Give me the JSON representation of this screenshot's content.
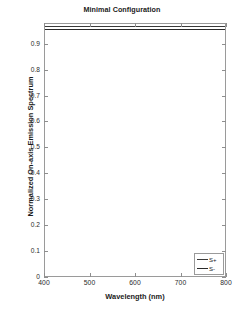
{
  "chart_data": {
    "type": "line",
    "title": "Minimal Configuration",
    "xlabel": "Wavelength (nm)",
    "ylabel": "Normalized On-axis Emission Spectrum",
    "xlim": [
      400,
      800
    ],
    "ylim": [
      0,
      0.98
    ],
    "grid": false,
    "legend_position": "lower right",
    "xticks": [
      400,
      500,
      600,
      700,
      800
    ],
    "xtick_labels": [
      "400",
      "500",
      "600",
      "700",
      "800"
    ],
    "yticks": [
      0,
      0.1,
      0.2,
      0.3,
      0.4,
      0.5,
      0.6,
      0.7,
      0.8,
      0.9
    ],
    "ytick_labels": [
      "0",
      "0.1",
      "0.2",
      "0.3",
      "0.4",
      "0.5",
      "0.6",
      "0.7",
      "0.8",
      "0.9"
    ],
    "x": [
      400,
      450,
      500,
      550,
      600,
      650,
      700,
      750,
      800
    ],
    "series": [
      {
        "name": "S+",
        "color": "#3a3a3a",
        "width": 1.4,
        "values": [
          0.968,
          0.968,
          0.968,
          0.968,
          0.968,
          0.968,
          0.968,
          0.968,
          0.968
        ]
      },
      {
        "name": "S-",
        "color": "#2b2b2b",
        "width": 1.4,
        "values": [
          0.957,
          0.957,
          0.957,
          0.957,
          0.957,
          0.957,
          0.957,
          0.957,
          0.957
        ]
      }
    ]
  },
  "legend": {
    "entries": [
      {
        "label": "S+"
      },
      {
        "label": "S-"
      }
    ]
  },
  "style": {
    "background": "#ffffff",
    "axis_color": "#9a9a9a",
    "text_color": "#1b1b1b"
  }
}
